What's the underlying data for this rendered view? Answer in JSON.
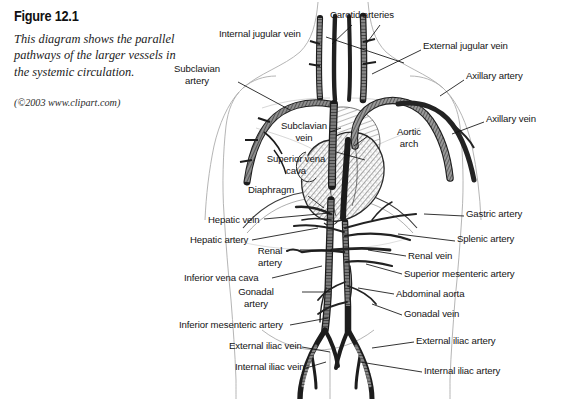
{
  "figure": {
    "number": "Figure 12.1",
    "caption": "This diagram shows the parallel pathways of the larger vessels in the systemic circulation.",
    "credit": "(©2003 www.clipart.com)"
  },
  "diagram": {
    "ink_color": "#1a1a1a",
    "body_outline_color": "#9a9a9a",
    "background": "#ffffff",
    "labels": [
      {
        "id": "carotid-arteries",
        "text": "Carotid arteries",
        "x": 330,
        "y": 14,
        "align": "left"
      },
      {
        "id": "internal-jugular-vein",
        "text": "Internal jugular vein",
        "x": 219,
        "y": 33,
        "align": "left"
      },
      {
        "id": "external-jugular-vein",
        "text": "External jugular vein",
        "x": 423,
        "y": 45,
        "align": "left"
      },
      {
        "id": "subclavian-artery",
        "text": "Subclavian artery",
        "x": 197,
        "y": 68,
        "align": "center",
        "wrap": true,
        "width": 66
      },
      {
        "id": "axillary-artery",
        "text": "Axillary artery",
        "x": 466,
        "y": 75,
        "align": "left"
      },
      {
        "id": "axillary-vein",
        "text": "Axillary vein",
        "x": 486,
        "y": 118,
        "align": "left"
      },
      {
        "id": "subclavian-vein",
        "text": "Subclavian vein",
        "x": 304,
        "y": 125,
        "align": "center",
        "wrap": true,
        "width": 64
      },
      {
        "id": "aortic-arch",
        "text": "Aortic arch",
        "x": 409,
        "y": 131,
        "align": "center",
        "wrap": true,
        "width": 44
      },
      {
        "id": "superior-vena-cava",
        "text": "Superior vena cava",
        "x": 296,
        "y": 158,
        "align": "center",
        "wrap": true,
        "width": 68
      },
      {
        "id": "diaphragm",
        "text": "Diaphragm",
        "x": 280,
        "y": 189,
        "align": "center"
      },
      {
        "id": "hepatic-vein",
        "text": "Hepatic vein",
        "x": 208,
        "y": 219,
        "align": "left"
      },
      {
        "id": "gastric-artery",
        "text": "Gastric artery",
        "x": 466,
        "y": 213,
        "align": "left"
      },
      {
        "id": "hepatic-artery",
        "text": "Hepatic artery",
        "x": 190,
        "y": 239,
        "align": "left"
      },
      {
        "id": "splenic-artery",
        "text": "Splenic artery",
        "x": 457,
        "y": 238,
        "align": "left"
      },
      {
        "id": "renal-artery",
        "text": "Renal artery",
        "x": 270,
        "y": 250,
        "align": "center",
        "wrap": true,
        "width": 46
      },
      {
        "id": "renal-vein",
        "text": "Renal vein",
        "x": 408,
        "y": 255,
        "align": "left"
      },
      {
        "id": "inferior-vena-cava",
        "text": "Inferior vena cava",
        "x": 184,
        "y": 277,
        "align": "left"
      },
      {
        "id": "superior-mesenteric-artery",
        "text": "Superior mesenteric artery",
        "x": 404,
        "y": 273,
        "align": "left"
      },
      {
        "id": "gonadal-artery",
        "text": "Gonadal artery",
        "x": 256,
        "y": 291,
        "align": "center",
        "wrap": true,
        "width": 50
      },
      {
        "id": "abdominal-aorta",
        "text": "Abdominal aorta",
        "x": 396,
        "y": 293,
        "align": "left"
      },
      {
        "id": "gonadal-vein",
        "text": "Gonadal vein",
        "x": 404,
        "y": 313,
        "align": "left"
      },
      {
        "id": "inferior-mesenteric-artery",
        "text": "Inferior mesenteric artery",
        "x": 179,
        "y": 324,
        "align": "left"
      },
      {
        "id": "external-iliac-artery",
        "text": "External iliac artery",
        "x": 416,
        "y": 340,
        "align": "left"
      },
      {
        "id": "external-iliac-vein",
        "text": "External iliac vein",
        "x": 229,
        "y": 345,
        "align": "left"
      },
      {
        "id": "internal-iliac-artery",
        "text": "Internal iliac artery",
        "x": 424,
        "y": 370,
        "align": "left"
      },
      {
        "id": "internal-iliac-vein",
        "text": "Internal iliac vein",
        "x": 235,
        "y": 366,
        "align": "left"
      }
    ]
  }
}
